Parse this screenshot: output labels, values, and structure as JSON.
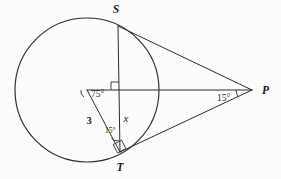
{
  "figure": {
    "type": "geometry-diagram",
    "background_color": "#fcfcfc",
    "stroke_color": "#2c2c2c",
    "width": 281,
    "height": 179
  },
  "points": {
    "center": {
      "name": "O",
      "x": 87,
      "y": 90,
      "labeled": false
    },
    "s": {
      "name": "S",
      "x": 118,
      "y": 26,
      "label_x": 116,
      "label_y": 13
    },
    "t": {
      "name": "T",
      "x": 120,
      "y": 152,
      "label_x": 120,
      "label_y": 170
    },
    "p": {
      "name": "P",
      "x": 252,
      "y": 90,
      "label_x": 264,
      "label_y": 93
    }
  },
  "circle": {
    "cx": 87,
    "cy": 90,
    "r": 72
  },
  "segments": [
    {
      "name": "chord-ST",
      "from": "S",
      "to": "T",
      "label": "x"
    },
    {
      "name": "radius-OT",
      "from": "center",
      "to": "T",
      "label": "3"
    },
    {
      "name": "axis-OP",
      "from": "center",
      "to": "P",
      "label": ""
    },
    {
      "name": "tangent-SP",
      "from": "S",
      "to": "P",
      "label": ""
    },
    {
      "name": "tangent-TP",
      "from": "T",
      "to": "P",
      "label": ""
    }
  ],
  "labels": {
    "angle_center": "75°",
    "angle_at_t": "15°",
    "angle_at_p": "15°",
    "side_radius": "3",
    "side_segment": "x",
    "point_s": "S",
    "point_t": "T",
    "point_p": "P"
  },
  "right_angles": [
    {
      "name": "right-angle-at-center",
      "at_x": 105,
      "at_y": 90,
      "note": "chord ST meets axis OP"
    },
    {
      "name": "right-angle-at-t",
      "at_x": 120,
      "at_y": 152,
      "note": "radius OT meets tangent TP"
    }
  ],
  "label_positions": {
    "angle_center": {
      "x": 92,
      "y": 96
    },
    "angle_at_t": {
      "x": 104,
      "y": 133
    },
    "angle_at_p": {
      "x": 222,
      "y": 99
    },
    "side_radius": {
      "x": 89,
      "y": 121
    },
    "side_segment": {
      "x": 124,
      "y": 120
    }
  }
}
